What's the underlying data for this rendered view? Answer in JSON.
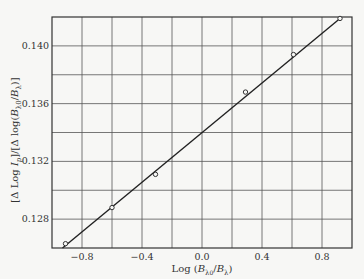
{
  "chart_data": {
    "type": "scatter",
    "title": "",
    "xlabel": "Log (B_λ0/B_λ)",
    "ylabel": "[Δ Log I_p]/[Δ log(B_λ0/B_λ)]",
    "xlim": [
      -1.0,
      1.0
    ],
    "ylim": [
      0.126,
      0.142
    ],
    "x_ticks": [
      -0.8,
      -0.4,
      0.0,
      0.4,
      0.8
    ],
    "x_tick_labels": [
      "−0.8",
      "−0.4",
      "0.0",
      "0.4",
      "0.8"
    ],
    "y_ticks": [
      0.128,
      0.132,
      0.136,
      0.14
    ],
    "y_tick_labels": [
      "0.128",
      "0.132",
      "0.136",
      "0.140"
    ],
    "x_grid": [
      -0.8,
      -0.6,
      -0.4,
      -0.2,
      0.0,
      0.2,
      0.4,
      0.6,
      0.8
    ],
    "y_grid": [
      0.128,
      0.13,
      0.132,
      0.134,
      0.136,
      0.138,
      0.14
    ],
    "grid": true,
    "legend": null,
    "series": [
      {
        "name": "measurements",
        "marker": "open-circle",
        "points": [
          {
            "x": -0.91,
            "y": 0.1263
          },
          {
            "x": -0.6,
            "y": 0.1288
          },
          {
            "x": -0.31,
            "y": 0.1311
          },
          {
            "x": 0.29,
            "y": 0.1368
          },
          {
            "x": 0.61,
            "y": 0.1394
          },
          {
            "x": 0.92,
            "y": 0.1419
          }
        ]
      },
      {
        "name": "linear fit",
        "type": "line",
        "points": [
          {
            "x": -0.93,
            "y": 0.126
          },
          {
            "x": 0.92,
            "y": 0.1419
          }
        ]
      }
    ]
  },
  "labels": {
    "xlabel_main": "Log",
    "ylabel_text": "[Δ Log I",
    "ylabel_sub": "p"
  }
}
